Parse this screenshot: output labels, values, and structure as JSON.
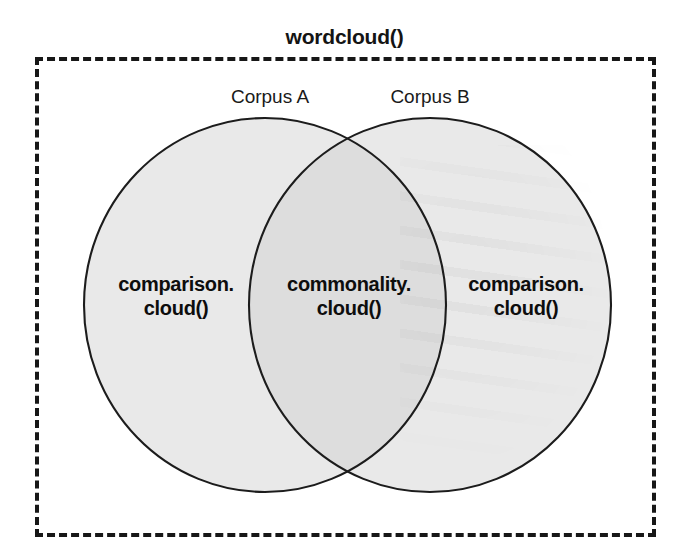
{
  "figure": {
    "title": "wordcloud()",
    "background_color": "#ffffff",
    "boundary": {
      "name": "wordcloud-boundary",
      "style": "dashed",
      "color": "#171717"
    }
  },
  "venn": {
    "type": "two-set-venn",
    "set_fill_color": "#e9e9e9",
    "intersection_fill_color": "#dcdcdc",
    "stroke_color": "#1a1a1a",
    "sets": [
      {
        "id": "corpus-a",
        "label": "Corpus A",
        "region_label_line1": "comparison.",
        "region_label_line2": "cloud()"
      },
      {
        "id": "corpus-b",
        "label": "Corpus B",
        "region_label_line1": "comparison.",
        "region_label_line2": "cloud()"
      }
    ],
    "intersection": {
      "id": "corpus-a-and-b",
      "region_label_line1": "commonality.",
      "region_label_line2": "cloud()"
    }
  }
}
